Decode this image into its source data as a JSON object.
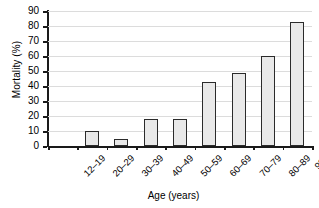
{
  "chart_data": {
    "type": "bar",
    "title": "",
    "xlabel": "Age (years)",
    "ylabel": "Mortality (%)",
    "categories": [
      "12–19",
      "20–29",
      "30–39",
      "40–49",
      "50–59",
      "60–69",
      "70–79",
      "80–89",
      "90+"
    ],
    "values": [
      0,
      10,
      5,
      18,
      18,
      43,
      49,
      60,
      83
    ],
    "ylim": [
      0,
      90
    ],
    "ytick_labels": [
      "0",
      "10",
      "20",
      "30",
      "40",
      "50",
      "60",
      "70",
      "80",
      "90"
    ],
    "ytick_values": [
      0,
      10,
      20,
      30,
      40,
      50,
      60,
      70,
      80,
      90
    ],
    "grid": "horizontal",
    "legend": "none",
    "bar_fill_color": "#e9e9e9",
    "bar_edge_color": "#2b2b2b",
    "grid_color": "#dcdcdc",
    "axis_color": "#1a1a1a",
    "background_color": "#ffffff"
  }
}
